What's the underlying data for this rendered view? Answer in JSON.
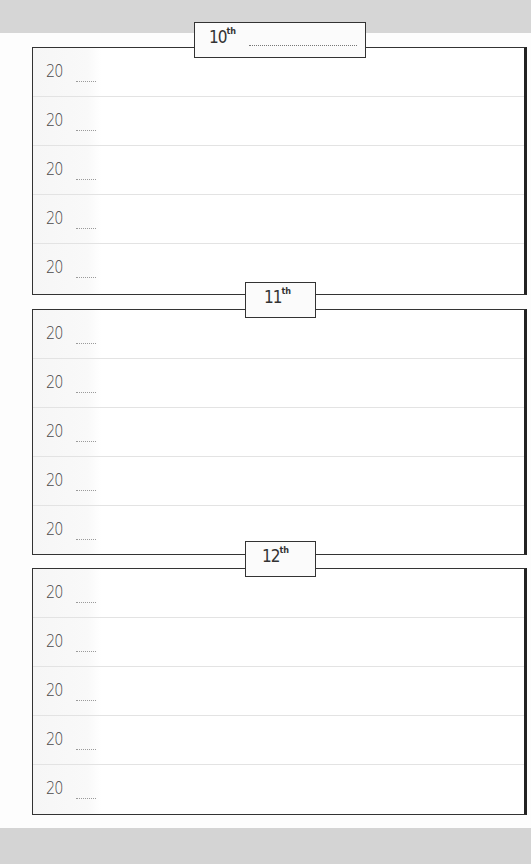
{
  "page": {
    "colors": {
      "background": "#fdfdfd",
      "band": "#d6d6d6",
      "border": "#333333",
      "row_divider": "#e3e3e3",
      "text": "#4a4a4a"
    }
  },
  "sections": [
    {
      "label": "10",
      "suffix": "th",
      "has_blank": true,
      "rows": [
        {
          "year_prefix": "20"
        },
        {
          "year_prefix": "20"
        },
        {
          "year_prefix": "20"
        },
        {
          "year_prefix": "20"
        },
        {
          "year_prefix": "20"
        }
      ]
    },
    {
      "label": "11",
      "suffix": "th",
      "has_blank": false,
      "rows": [
        {
          "year_prefix": "20"
        },
        {
          "year_prefix": "20"
        },
        {
          "year_prefix": "20"
        },
        {
          "year_prefix": "20"
        },
        {
          "year_prefix": "20"
        }
      ]
    },
    {
      "label": "12",
      "suffix": "th",
      "has_blank": false,
      "rows": [
        {
          "year_prefix": "20"
        },
        {
          "year_prefix": "20"
        },
        {
          "year_prefix": "20"
        },
        {
          "year_prefix": "20"
        },
        {
          "year_prefix": "20"
        }
      ]
    }
  ]
}
